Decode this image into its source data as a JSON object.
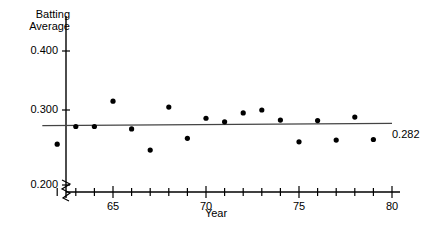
{
  "chart_data": {
    "type": "scatter",
    "title": "",
    "xlabel": "Year",
    "ylabel": "Batting\nAverage",
    "xlim": [
      61,
      80
    ],
    "ylim": [
      0.2,
      0.42
    ],
    "grid": false,
    "legend": "none",
    "y_axis_break": true,
    "y_ticks": [
      {
        "value": 0.4,
        "label": "0.400"
      },
      {
        "value": 0.3,
        "label": "0.300"
      },
      {
        "value": 0.2,
        "label": "0.200"
      }
    ],
    "x_ticks": [
      {
        "value": 62,
        "label": ""
      },
      {
        "value": 63,
        "label": ""
      },
      {
        "value": 64,
        "label": ""
      },
      {
        "value": 65,
        "label": "65"
      },
      {
        "value": 66,
        "label": ""
      },
      {
        "value": 67,
        "label": ""
      },
      {
        "value": 68,
        "label": ""
      },
      {
        "value": 69,
        "label": ""
      },
      {
        "value": 70,
        "label": "70"
      },
      {
        "value": 71,
        "label": ""
      },
      {
        "value": 72,
        "label": ""
      },
      {
        "value": 73,
        "label": ""
      },
      {
        "value": 74,
        "label": ""
      },
      {
        "value": 75,
        "label": "75"
      },
      {
        "value": 76,
        "label": ""
      },
      {
        "value": 77,
        "label": ""
      },
      {
        "value": 78,
        "label": ""
      },
      {
        "value": 79,
        "label": ""
      },
      {
        "value": 80,
        "label": "80"
      }
    ],
    "x": [
      62,
      63,
      64,
      65,
      66,
      67,
      68,
      69,
      70,
      71,
      72,
      73,
      74,
      75,
      76,
      77,
      78,
      79
    ],
    "y": [
      0.242,
      0.272,
      0.272,
      0.315,
      0.268,
      0.232,
      0.305,
      0.252,
      0.286,
      0.28,
      0.295,
      0.3,
      0.283,
      0.246,
      0.282,
      0.249,
      0.288,
      0.25
    ],
    "points": [
      {
        "x": 62,
        "y": 0.242
      },
      {
        "x": 63,
        "y": 0.272
      },
      {
        "x": 64,
        "y": 0.272
      },
      {
        "x": 65,
        "y": 0.315
      },
      {
        "x": 66,
        "y": 0.268
      },
      {
        "x": 67,
        "y": 0.232
      },
      {
        "x": 68,
        "y": 0.305
      },
      {
        "x": 69,
        "y": 0.252
      },
      {
        "x": 70,
        "y": 0.286
      },
      {
        "x": 71,
        "y": 0.28
      },
      {
        "x": 72,
        "y": 0.295
      },
      {
        "x": 73,
        "y": 0.3
      },
      {
        "x": 74,
        "y": 0.283
      },
      {
        "x": 75,
        "y": 0.246
      },
      {
        "x": 76,
        "y": 0.282
      },
      {
        "x": 77,
        "y": 0.249
      },
      {
        "x": 78,
        "y": 0.288
      },
      {
        "x": 79,
        "y": 0.25
      }
    ],
    "trend_line": {
      "label": "0.282",
      "x_start": 61.2,
      "y_start": 0.2735,
      "x_end": 80.0,
      "y_end": 0.2775
    },
    "colors": {
      "axis": "#000000",
      "point": "#000000",
      "trend": "#444444",
      "text": "#000000"
    }
  }
}
